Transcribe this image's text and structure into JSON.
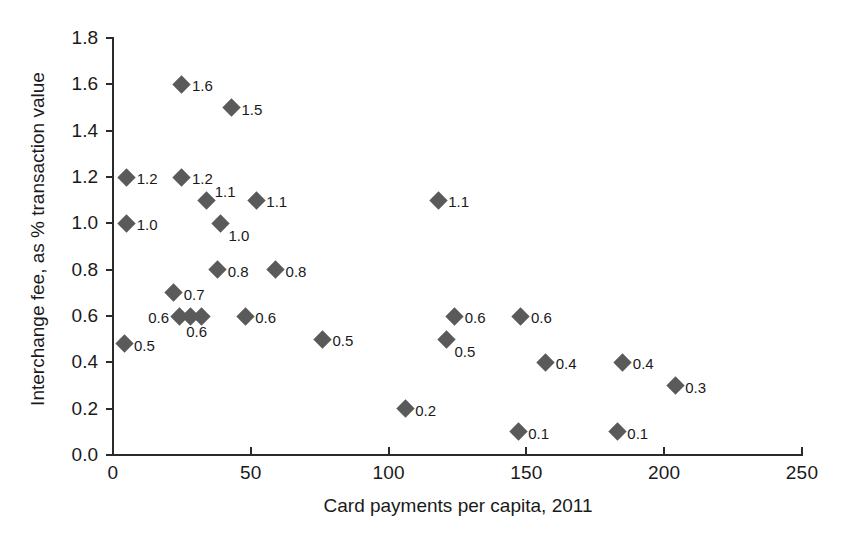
{
  "chart_data": {
    "type": "scatter",
    "title": "",
    "xlabel": "Card payments per capita, 2011",
    "ylabel": "Interchange fee, as % transaction value",
    "xlim": [
      0,
      250
    ],
    "ylim": [
      0.0,
      1.8
    ],
    "xticks": [
      "0",
      "50",
      "100",
      "150",
      "200",
      "250"
    ],
    "xtick_values": [
      0,
      50,
      100,
      150,
      200,
      250
    ],
    "yticks": [
      "0.0",
      "0.2",
      "0.4",
      "0.6",
      "0.8",
      "1.0",
      "1.2",
      "1.4",
      "1.6",
      "1.8"
    ],
    "ytick_values": [
      0.0,
      0.2,
      0.4,
      0.6,
      0.8,
      1.0,
      1.2,
      1.4,
      1.6,
      1.8
    ],
    "grid": false,
    "legend": null,
    "marker": "diamond",
    "marker_color": "#5a5a5a",
    "points": [
      {
        "x": 5,
        "y": 1.2,
        "label": "1.2",
        "pos": "right"
      },
      {
        "x": 5,
        "y": 1.0,
        "label": "1.0",
        "pos": "right"
      },
      {
        "x": 4,
        "y": 0.48,
        "label": "0.5",
        "pos": "right"
      },
      {
        "x": 22,
        "y": 0.7,
        "label": "0.7",
        "pos": "right"
      },
      {
        "x": 25,
        "y": 1.2,
        "label": "1.2",
        "pos": "right"
      },
      {
        "x": 24,
        "y": 0.6,
        "label": "0.6",
        "pos": "left"
      },
      {
        "x": 28,
        "y": 0.6,
        "label": "0.6",
        "pos": "below"
      },
      {
        "x": 32,
        "y": 0.6,
        "label": "",
        "pos": "right"
      },
      {
        "x": 25,
        "y": 1.6,
        "label": "1.6",
        "pos": "right"
      },
      {
        "x": 34,
        "y": 1.1,
        "label": "1.1",
        "pos": "ne"
      },
      {
        "x": 38,
        "y": 0.8,
        "label": "0.8",
        "pos": "right"
      },
      {
        "x": 39,
        "y": 1.0,
        "label": "1.0",
        "pos": "se"
      },
      {
        "x": 43,
        "y": 1.5,
        "label": "1.5",
        "pos": "right"
      },
      {
        "x": 48,
        "y": 0.6,
        "label": "0.6",
        "pos": "right"
      },
      {
        "x": 52,
        "y": 1.1,
        "label": "1.1",
        "pos": "right"
      },
      {
        "x": 59,
        "y": 0.8,
        "label": "0.8",
        "pos": "right"
      },
      {
        "x": 76,
        "y": 0.5,
        "label": "0.5",
        "pos": "right"
      },
      {
        "x": 106,
        "y": 0.2,
        "label": "0.2",
        "pos": "right"
      },
      {
        "x": 118,
        "y": 1.1,
        "label": "1.1",
        "pos": "right"
      },
      {
        "x": 124,
        "y": 0.6,
        "label": "0.6",
        "pos": "right"
      },
      {
        "x": 121,
        "y": 0.5,
        "label": "0.5",
        "pos": "se"
      },
      {
        "x": 147,
        "y": 0.1,
        "label": "0.1",
        "pos": "right"
      },
      {
        "x": 157,
        "y": 0.4,
        "label": "0.4",
        "pos": "right"
      },
      {
        "x": 148,
        "y": 0.6,
        "label": "0.6",
        "pos": "right"
      },
      {
        "x": 183,
        "y": 0.1,
        "label": "0.1",
        "pos": "right"
      },
      {
        "x": 185,
        "y": 0.4,
        "label": "0.4",
        "pos": "right"
      },
      {
        "x": 204,
        "y": 0.3,
        "label": "0.3",
        "pos": "right"
      }
    ]
  }
}
